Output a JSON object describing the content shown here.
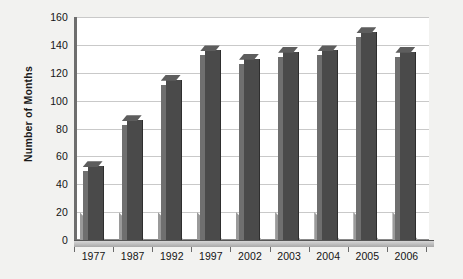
{
  "chart_data": {
    "type": "bar",
    "title": "",
    "xlabel": "",
    "ylabel": "Number of Months",
    "categories": [
      "1977",
      "1987",
      "1992",
      "1997",
      "2002",
      "2003",
      "2004",
      "2005",
      "2006"
    ],
    "values": [
      53,
      86,
      115,
      136,
      130,
      135,
      136,
      149,
      135
    ],
    "ylim": [
      0,
      160
    ],
    "ytick_labels": [
      "0",
      "20",
      "40",
      "60",
      "80",
      "100",
      "120",
      "140",
      "160"
    ],
    "ytick_values": [
      0,
      20,
      40,
      60,
      80,
      100,
      120,
      140,
      160
    ],
    "grid": true,
    "legend": "none",
    "bar_color": "#4a4a4a",
    "bar_side_color": "#6f6f6f",
    "bar_top_color": "#5d5d5d",
    "grid_color": "#c9c9c9",
    "axis_color": "#6e6e6e",
    "plot_background": "#ffffff",
    "page_background": "#f2f2f0",
    "style": "3d-column"
  }
}
